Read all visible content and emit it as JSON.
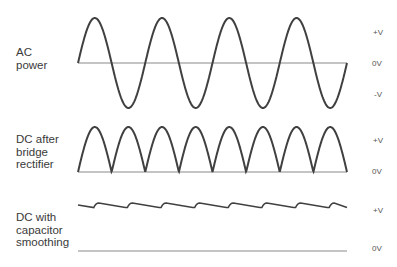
{
  "rows": [
    {
      "label_lines": [
        "AC",
        "power"
      ],
      "levels": [
        "+V",
        "0V",
        "-V"
      ]
    },
    {
      "label_lines": [
        "DC after",
        "bridge",
        "rectifier"
      ],
      "levels": [
        "+V",
        "0V"
      ]
    },
    {
      "label_lines": [
        "DC with",
        "capacitor",
        "smoothing"
      ],
      "levels": [
        "+V",
        "0V"
      ]
    }
  ],
  "colors": {
    "wave": "#404040",
    "axis": "#8a8a8a",
    "text": "#3a3a3a"
  }
}
